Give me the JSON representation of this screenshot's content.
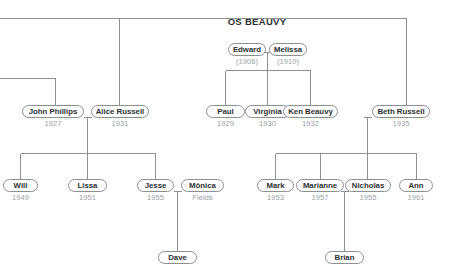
{
  "title": "OS BEAUVY",
  "accent_color": "#8b9096",
  "line_color": "#8b9096",
  "name_color": "#2b2f33",
  "sub_color": "#9aa0a6",
  "background_color": "#ffffff",
  "persons": [
    {
      "id": "edward",
      "name": "Edward",
      "sub": "(1906)"
    },
    {
      "id": "melissa",
      "name": "Melissa",
      "sub": "(1910)"
    },
    {
      "id": "john",
      "name": "John Phillips",
      "sub": "1927"
    },
    {
      "id": "alice",
      "name": "Alice Russell",
      "sub": "1931"
    },
    {
      "id": "paul",
      "name": "Paul",
      "sub": "1929"
    },
    {
      "id": "virginia",
      "name": "Virginia",
      "sub": "1930"
    },
    {
      "id": "ken",
      "name": "Ken Beauvy",
      "sub": "1932"
    },
    {
      "id": "beth",
      "name": "Beth Russell",
      "sub": "1935"
    },
    {
      "id": "will",
      "name": "Will",
      "sub": "1949"
    },
    {
      "id": "lissa",
      "name": "Lissa",
      "sub": "1951"
    },
    {
      "id": "jesse",
      "name": "Jesse",
      "sub": "1955"
    },
    {
      "id": "monica",
      "name": "Mônica",
      "sub": "Fields"
    },
    {
      "id": "mark",
      "name": "Mark",
      "sub": "1953"
    },
    {
      "id": "marianne",
      "name": "Marianne",
      "sub": "1957"
    },
    {
      "id": "nicholas",
      "name": "Nicholas",
      "sub": "1955"
    },
    {
      "id": "ann",
      "name": "Ann",
      "sub": "1961"
    },
    {
      "id": "dave",
      "name": "Dave",
      "sub": ""
    },
    {
      "id": "brian",
      "name": "Brian",
      "sub": ""
    }
  ],
  "generations": {
    "g1": [
      "edward",
      "melissa"
    ],
    "g2": [
      "john",
      "alice",
      "paul",
      "virginia",
      "ken",
      "beth"
    ],
    "g3": [
      "will",
      "lissa",
      "jesse",
      "monica",
      "mark",
      "marianne",
      "nicholas",
      "ann"
    ],
    "g4": [
      "dave",
      "brian"
    ]
  },
  "unions": [
    {
      "partners": [
        "edward",
        "melissa"
      ],
      "children": [
        "paul",
        "virginia",
        "ken"
      ]
    },
    {
      "partners": [
        "john",
        "alice"
      ],
      "children": [
        "will",
        "lissa",
        "jesse"
      ]
    },
    {
      "partners": [
        "ken",
        "beth"
      ],
      "children": [
        "mark",
        "marianne",
        "nicholas",
        "ann"
      ]
    },
    {
      "partners": [
        "jesse",
        "monica"
      ],
      "children": [
        "dave"
      ]
    },
    {
      "partners": [
        "marianne",
        "nicholas"
      ],
      "children": [
        "brian"
      ]
    }
  ]
}
